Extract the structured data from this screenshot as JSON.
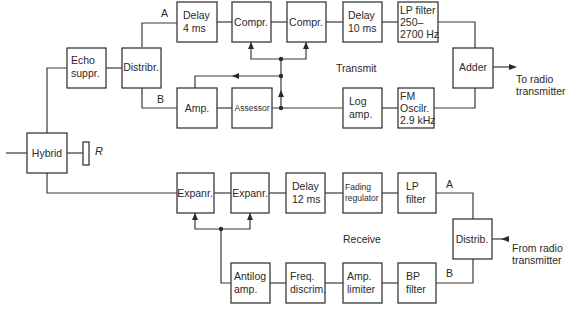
{
  "diagram": {
    "sections": {
      "transmit": "Transmit",
      "receive": "Receive"
    },
    "blocks": {
      "hybrid": [
        "Hybrid"
      ],
      "resistor": "R",
      "echo_suppr": [
        "Echo",
        "suppr."
      ],
      "distribr_tx": [
        "Distribr."
      ],
      "delay4": [
        "Delay",
        "4 ms"
      ],
      "compr1": [
        "Compr."
      ],
      "compr2": [
        "Compr."
      ],
      "delay10": [
        "Delay",
        "10 ms"
      ],
      "lp_filter_tx": [
        "LP filter",
        "250–",
        "2700 Hz"
      ],
      "adder": [
        "Adder"
      ],
      "amp_tx": [
        "Amp."
      ],
      "assessor": [
        "Assessor"
      ],
      "log_amp": [
        "Log",
        "amp."
      ],
      "fm_osc": [
        "FM",
        "Oscilr.",
        "2.9 kHz"
      ],
      "expanr1": [
        "Expanr."
      ],
      "expanr2": [
        "Expanr."
      ],
      "delay12": [
        "Delay",
        "12 ms"
      ],
      "fading_reg": [
        "Fading",
        "regulator"
      ],
      "lp_filter_rx": [
        "LP",
        "filter"
      ],
      "distrib_rx": [
        "Distrib."
      ],
      "antilog_amp": [
        "Antilog",
        "amp."
      ],
      "freq_discrim": [
        "Freq.",
        "discrim."
      ],
      "amp_limiter": [
        "Amp.",
        "limiter"
      ],
      "bp_filter": [
        "BP",
        "filter"
      ]
    },
    "path_labels": {
      "tx_a": "A",
      "tx_b": "B",
      "rx_a": "A",
      "rx_b": "B"
    },
    "external": {
      "to_radio": [
        "To radio",
        "transmitter"
      ],
      "from_radio": [
        "From radio",
        "transmitter"
      ]
    }
  }
}
